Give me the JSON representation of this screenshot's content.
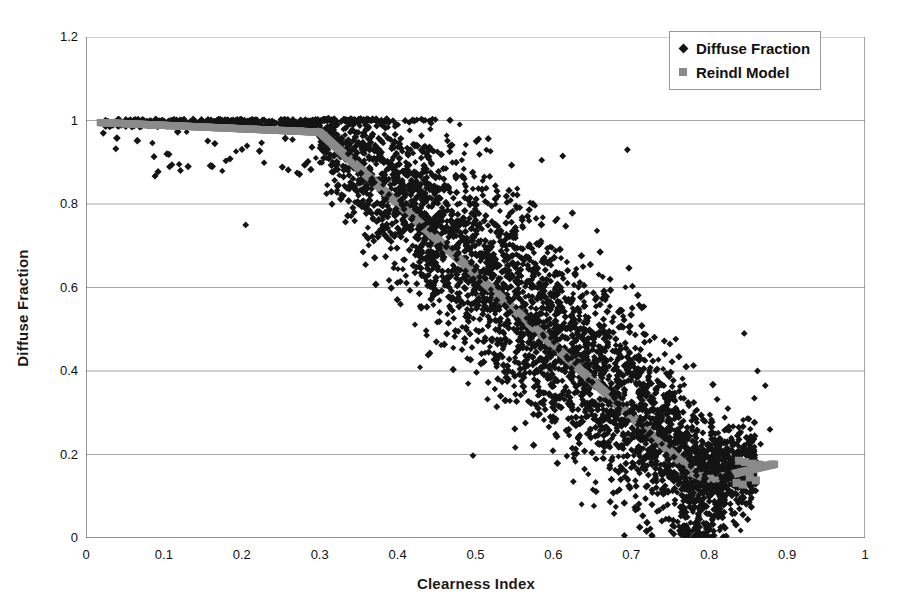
{
  "chart_data": {
    "type": "scatter",
    "title": "",
    "xlabel": "Clearness Index",
    "ylabel": "Diffuse Fraction",
    "xlim": [
      0,
      1
    ],
    "ylim": [
      0,
      1.2
    ],
    "xticks": [
      "0",
      "0.1",
      "0.2",
      "0.3",
      "0.4",
      "0.5",
      "0.6",
      "0.7",
      "0.8",
      "0.9",
      "1"
    ],
    "yticks": [
      "0",
      "0.2",
      "0.4",
      "0.6",
      "0.8",
      "1",
      "1.2"
    ],
    "xtick_values": [
      0,
      0.1,
      0.2,
      0.3,
      0.4,
      0.5,
      0.6,
      0.7,
      0.8,
      0.9,
      1
    ],
    "ytick_values": [
      0,
      0.2,
      0.4,
      0.6,
      0.8,
      1,
      1.2
    ],
    "grid": "horizontal",
    "legend_position": "top-right",
    "series": [
      {
        "name": "Diffuse Fraction",
        "marker": "diamond",
        "color": "#141414",
        "size": 6,
        "description": "Measured hourly diffuse fraction vs clearness index; dense cloud capped at 1.0 for kt<0.32, decreasing to near 0.03 at kt~0.78, with wide vertical spread of about +/-0.15 around the model line.",
        "x_range": [
          0.02,
          0.88
        ],
        "y_range": [
          0.0,
          1.01
        ]
      },
      {
        "name": "Reindl Model",
        "marker": "square",
        "color": "#8a8a8a",
        "size": 6,
        "description": "Piecewise Reindl correlation: flat near 0.985 up to kt=0.30, linear decline to about 0.14 at kt=0.80, then a short flat tail with scattered points near 0.17-0.18 out to kt=0.88.",
        "breakpoints": [
          {
            "x": 0.02,
            "y": 0.995
          },
          {
            "x": 0.3,
            "y": 0.972
          },
          {
            "x": 0.78,
            "y": 0.155
          },
          {
            "x": 0.8,
            "y": 0.14
          },
          {
            "x": 0.85,
            "y": 0.135
          },
          {
            "x": 0.88,
            "y": 0.175
          }
        ]
      }
    ]
  },
  "legend": {
    "items": [
      {
        "label": "Diffuse Fraction",
        "marker": "diamond"
      },
      {
        "label": "Reindl Model",
        "marker": "square"
      }
    ]
  },
  "colors": {
    "scatter": "#141414",
    "model": "#8a8a8a",
    "grid": "#a6a6a6",
    "axis": "#6e6e6e",
    "background": "#ffffff"
  }
}
